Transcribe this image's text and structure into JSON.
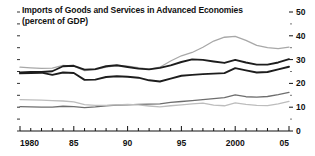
{
  "chart_data": {
    "type": "line",
    "title": "Imports of Goods and Services in Advanced Economies",
    "subtitle": "(percent of GDP)",
    "xlabel": "",
    "ylabel": "",
    "ylim": [
      0,
      50
    ],
    "xlim": [
      1980,
      2005
    ],
    "yticks": [
      0,
      10,
      20,
      30,
      40,
      50
    ],
    "ytick_labels": [
      "0",
      "10",
      "20",
      "30",
      "40",
      "50"
    ],
    "y_axis_position": "right",
    "minor_yticks": [
      5,
      15,
      25,
      35,
      45
    ],
    "xticks": [
      1980,
      1985,
      1990,
      1995,
      2000,
      2005
    ],
    "xtick_labels": [
      "1980",
      "85",
      "90",
      "95",
      "2000",
      "05"
    ],
    "minor_xtick_interval": 1,
    "grid": false,
    "legend": "none",
    "x": [
      1980,
      1981,
      1982,
      1983,
      1984,
      1985,
      1986,
      1987,
      1988,
      1989,
      1990,
      1991,
      1992,
      1993,
      1994,
      1995,
      1996,
      1997,
      1998,
      1999,
      2000,
      2001,
      2002,
      2003,
      2004,
      2005
    ],
    "series": [
      {
        "name": "series-1-light-gray-upper",
        "color": "#a8a8a8",
        "width": 1.3,
        "values": [
          26.8,
          26.5,
          26.3,
          26.4,
          27.6,
          27.3,
          25.4,
          25.8,
          26.8,
          27.5,
          27.2,
          26.6,
          26.0,
          26.8,
          29.4,
          31.6,
          33.0,
          35.2,
          37.8,
          39.4,
          39.8,
          38.1,
          36.0,
          35.0,
          34.6,
          35.2
        ]
      },
      {
        "name": "series-2-dark-upper",
        "color": "#1d1d1d",
        "width": 1.9,
        "values": [
          24.6,
          24.8,
          24.8,
          25.1,
          27.2,
          27.4,
          25.8,
          26.0,
          27.2,
          27.6,
          26.9,
          26.2,
          25.9,
          26.5,
          27.6,
          29.0,
          30.1,
          29.9,
          29.2,
          28.6,
          29.9,
          28.8,
          27.9,
          27.9,
          28.8,
          30.2
        ]
      },
      {
        "name": "series-3-dark-lower",
        "color": "#1d1d1d",
        "width": 1.9,
        "values": [
          24.2,
          24.4,
          24.5,
          23.6,
          24.6,
          24.4,
          21.5,
          21.6,
          22.7,
          23.0,
          22.8,
          22.4,
          21.3,
          20.8,
          22.0,
          23.2,
          23.6,
          23.9,
          24.1,
          24.3,
          26.4,
          25.5,
          24.6,
          24.8,
          25.9,
          27.0
        ]
      },
      {
        "name": "series-4-medium-gray-lower",
        "color": "#6e6e6e",
        "width": 1.3,
        "values": [
          10.2,
          10.1,
          10.0,
          10.0,
          10.4,
          10.2,
          9.8,
          10.1,
          10.6,
          10.9,
          11.0,
          11.2,
          11.3,
          11.4,
          12.0,
          12.4,
          12.8,
          13.2,
          13.6,
          14.0,
          15.2,
          14.4,
          14.2,
          14.5,
          15.3,
          16.2
        ]
      },
      {
        "name": "series-5-light-gray-lowest",
        "color": "#bdbdbd",
        "width": 1.3,
        "values": [
          13.2,
          13.1,
          13.0,
          12.8,
          12.6,
          12.2,
          11.1,
          10.8,
          10.8,
          11.0,
          11.2,
          11.0,
          10.5,
          10.1,
          10.6,
          11.0,
          11.4,
          11.7,
          10.9,
          10.6,
          11.8,
          11.2,
          10.8,
          10.7,
          11.4,
          12.4
        ]
      }
    ]
  },
  "axes": {
    "right_tick_labels": [
      "50",
      "40",
      "30",
      "20",
      "10",
      "0"
    ],
    "bottom_tick_labels": [
      "1980",
      "85",
      "90",
      "95",
      "2000",
      "05"
    ]
  }
}
